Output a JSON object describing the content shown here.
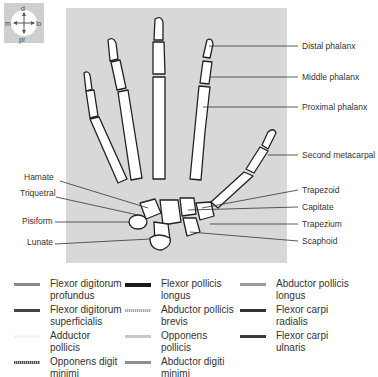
{
  "orientation_compass": {
    "top": "d",
    "bottom": "pr",
    "left": "m",
    "right": "lo"
  },
  "labels_right": [
    {
      "text": "Distal phalanx",
      "y": 46
    },
    {
      "text": "Middle phalanx",
      "y": 77
    },
    {
      "text": "Proximal phalanx",
      "y": 107
    },
    {
      "text": "Second metacarpal",
      "y": 155
    },
    {
      "text": "Trapezoid",
      "y": 190
    },
    {
      "text": "Capitate",
      "y": 207
    },
    {
      "text": "Trapezium",
      "y": 224
    },
    {
      "text": "Scaphoid",
      "y": 241
    }
  ],
  "labels_left": [
    {
      "text": "Hamate",
      "y": 177
    },
    {
      "text": "Triquetral",
      "y": 193
    },
    {
      "text": "Pisiform",
      "y": 221
    },
    {
      "text": "Lunate",
      "y": 242
    }
  ],
  "legend": [
    {
      "label": "Flexor digitorum profundus",
      "line1": "Flexor digitorum",
      "line2": "profundus",
      "color": "#8a8a8a",
      "style": "solid"
    },
    {
      "label": "Flexor pollicis longus",
      "line1": "Flexor pollicis",
      "line2": "longus",
      "color": "#1a1a1a",
      "style": "solid"
    },
    {
      "label": "Abductor pollicis longus",
      "line1": "Abductor pollicis",
      "line2": "longus",
      "color": "#9a9a9a",
      "style": "solid"
    },
    {
      "label": "Flexor digitorum superficialis",
      "line1": "Flexor digitorum",
      "line2": "superficialis",
      "color": "#444444",
      "style": "solid"
    },
    {
      "label": "Abductor pollicis brevis",
      "line1": "Abductor pollicis",
      "line2": "brevis",
      "color": "#b0b0b0",
      "style": "dotted"
    },
    {
      "label": "Flexor carpi radialis",
      "line1": "Flexor carpi",
      "line2": "radialis",
      "color": "#333333",
      "style": "solid"
    },
    {
      "label": "Adductor pollicis",
      "line1": "Adductor",
      "line2": "pollicis",
      "color": "#f4f4f4",
      "style": "solid"
    },
    {
      "label": "Opponens pollicis",
      "line1": "Opponens",
      "line2": "pollicis",
      "color": "#c8c8c8",
      "style": "solid"
    },
    {
      "label": "Flexor carpi ulnaris",
      "line1": "Flexor carpi",
      "line2": "ulnaris",
      "color": "#3a3a3a",
      "style": "solid"
    },
    {
      "label": "Opponens digiti minimi",
      "line1": "Opponens digit",
      "line2": "minimi",
      "color": "#666666",
      "style": "dotted"
    },
    {
      "label": "Abductor digiti minimi",
      "line1": "Abductor digiti",
      "line2": "minimi",
      "color": "#8f8f8f",
      "style": "solid"
    }
  ]
}
